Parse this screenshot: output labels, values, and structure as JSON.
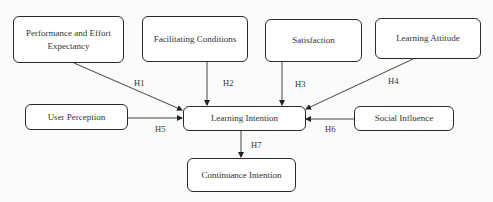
{
  "diagram": {
    "nodes": [
      {
        "id": "pee",
        "label": "Performance and Effort Expectancy"
      },
      {
        "id": "fc",
        "label": "Facilitating Conditions"
      },
      {
        "id": "sat",
        "label": "Satisfaction"
      },
      {
        "id": "la",
        "label": "Learning Attitude"
      },
      {
        "id": "up",
        "label": "User Perception"
      },
      {
        "id": "li",
        "label": "Learning Intention"
      },
      {
        "id": "si",
        "label": "Social Influence"
      },
      {
        "id": "ci",
        "label": "Continuance Intention"
      }
    ],
    "edges": [
      {
        "from": "pee",
        "to": "li",
        "label": "H1"
      },
      {
        "from": "fc",
        "to": "li",
        "label": "H2"
      },
      {
        "from": "sat",
        "to": "li",
        "label": "H3"
      },
      {
        "from": "la",
        "to": "li",
        "label": "H4"
      },
      {
        "from": "up",
        "to": "li",
        "label": "H5"
      },
      {
        "from": "si",
        "to": "li",
        "label": "H6"
      },
      {
        "from": "li",
        "to": "ci",
        "label": "H7"
      }
    ]
  }
}
